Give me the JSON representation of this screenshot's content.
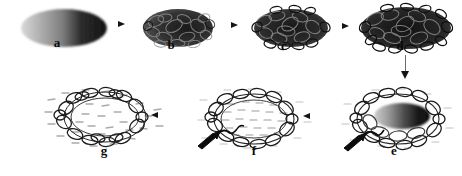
{
  "figure": {
    "type": "micrograph-sequence",
    "panel_count": 7,
    "rows": 2,
    "background_color": "#ffffff",
    "ink_color": "#141414"
  },
  "panels": [
    {
      "id": "a",
      "label": "a",
      "row": 1,
      "order": 1,
      "description": "smooth solid ellipse, light-to-dark gradient left to right",
      "morphology": "smooth-ellipse",
      "interior": "solid-gradient",
      "fill_light": "#b9b9b9",
      "fill_dark": "#1e1e1e",
      "width": 90,
      "height": 42,
      "cx": 64,
      "cy": 28
    },
    {
      "id": "b",
      "label": "b",
      "row": 1,
      "order": 2,
      "description": "dark textured blob, coiled loops beginning to emerge at surface",
      "morphology": "textured-blob",
      "interior": "dense-dark",
      "fill_light": "#777777",
      "fill_dark": "#171717",
      "width": 74,
      "height": 42,
      "cx": 177,
      "cy": 27
    },
    {
      "id": "c",
      "label": "c",
      "row": 1,
      "order": 3,
      "description": "dense dark mass with distinct loop rings visible along the margin",
      "morphology": "looped-mass",
      "interior": "dense-dark",
      "fill_light": "#6e6e6e",
      "fill_dark": "#141414",
      "width": 80,
      "height": 44,
      "cx": 290,
      "cy": 28
    },
    {
      "id": "d",
      "label": "d",
      "row": 1,
      "order": 4,
      "description": "largest densest mass of tangled loops, maximum condensation",
      "morphology": "looped-mass",
      "interior": "dense-dark",
      "fill_light": "#6a6a6a",
      "fill_dark": "#111111",
      "width": 96,
      "height": 50,
      "cx": 405,
      "cy": 30
    },
    {
      "id": "e",
      "label": "e",
      "row": 2,
      "order": 5,
      "description": "loop ring opened around a dark gradient oval core, black protrusion at lower left",
      "morphology": "ring-with-core",
      "interior": "dark-oval-core",
      "fill_light": "#9a9a9a",
      "fill_dark": "#101010",
      "width": 98,
      "height": 60,
      "cx": 396,
      "cy": 120,
      "has_marker_arrow": true
    },
    {
      "id": "f",
      "label": "f",
      "row": 2,
      "order": 6,
      "description": "loop ring with pale dashed interior, core released, black protrusion at lower left",
      "morphology": "ring-hollow",
      "interior": "pale-dashes",
      "fill_light": "#c8c8c8",
      "fill_dark": "#1a1a1a",
      "width": 96,
      "height": 58,
      "cx": 254,
      "cy": 119,
      "has_marker_arrow": true
    },
    {
      "id": "g",
      "label": "g",
      "row": 2,
      "order": 7,
      "description": "open loop ring, hollow centre, dashed particles dispersed all around",
      "morphology": "ring-hollow",
      "interior": "pale-dashes",
      "fill_light": "#d2d2d2",
      "fill_dark": "#1c1c1c",
      "width": 94,
      "height": 60,
      "cx": 104,
      "cy": 118,
      "has_marker_arrow": false
    }
  ],
  "arrows": [
    {
      "id": "a-to-b",
      "direction": "right",
      "from": "a",
      "to": "b",
      "x": 120,
      "y": 24
    },
    {
      "id": "b-to-c",
      "direction": "right",
      "from": "b",
      "to": "c",
      "x": 234,
      "y": 25
    },
    {
      "id": "c-to-d",
      "direction": "right",
      "from": "c",
      "to": "d",
      "x": 345,
      "y": 26
    },
    {
      "id": "d-to-e",
      "direction": "down",
      "from": "d",
      "to": "e",
      "x": 405,
      "y": 58
    },
    {
      "id": "e-to-f",
      "direction": "left",
      "from": "e",
      "to": "f",
      "x": 303,
      "y": 114
    },
    {
      "id": "f-to-g",
      "direction": "left",
      "from": "f",
      "to": "g",
      "x": 151,
      "y": 113
    }
  ],
  "labels": {
    "a": {
      "text": "a",
      "x": 57,
      "y": 42
    },
    "b": {
      "text": "b",
      "x": 171,
      "y": 44
    },
    "c": {
      "text": "c",
      "x": 284,
      "y": 45
    },
    "d": {
      "text": "d",
      "x": 400,
      "y": 45
    },
    "e": {
      "text": "e",
      "x": 391,
      "y": 150
    },
    "f": {
      "text": "f",
      "x": 250,
      "y": 150
    },
    "g": {
      "text": "g",
      "x": 100,
      "y": 150
    }
  }
}
